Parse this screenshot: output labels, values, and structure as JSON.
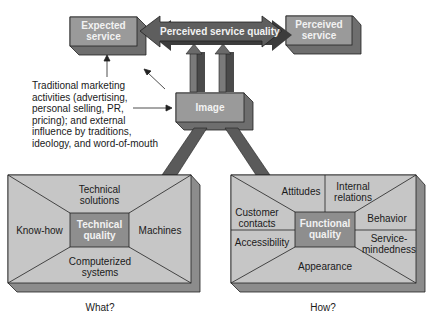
{
  "diagram": {
    "title": "",
    "colors": {
      "box_face": "#9a9a9a",
      "box_side": "#6e6e6e",
      "box_bottom": "#7c7c7c",
      "arrow_dark": "#4a4a4a",
      "arrow_mid": "#6a6a6a",
      "panel_face": "#c6c6c6",
      "panel_side": "#8c8c8c",
      "center_box": "#8e8e8e",
      "edge": "#222222"
    },
    "top": {
      "expected_service": [
        "Expected",
        "service"
      ],
      "perceived_service_quality": "Perceived service quality",
      "perceived_service": [
        "Perceived",
        "service"
      ]
    },
    "image": {
      "label": "Image"
    },
    "influences_note": [
      "Traditional marketing",
      "activities (advertising,",
      "personal selling, PR,",
      "pricing); and external",
      "influence by traditions,",
      "ideology, and word-of-mouth"
    ],
    "technical_panel": {
      "center": [
        "Technical",
        "quality"
      ],
      "top": [
        "Technical",
        "solutions"
      ],
      "left": "Know-how",
      "right": "Machines",
      "bottom": [
        "Computerized",
        "systems"
      ],
      "caption": "What?"
    },
    "functional_panel": {
      "center": [
        "Functional",
        "quality"
      ],
      "top_left": "Attitudes",
      "top_right": [
        "Internal",
        "relations"
      ],
      "left_top": [
        "Customer",
        "contacts"
      ],
      "left_bottom": "Accessibility",
      "right_top": "Behavior",
      "right_bottom": [
        "Service-",
        "mindedness"
      ],
      "bottom": "Appearance",
      "caption": "How?"
    }
  }
}
